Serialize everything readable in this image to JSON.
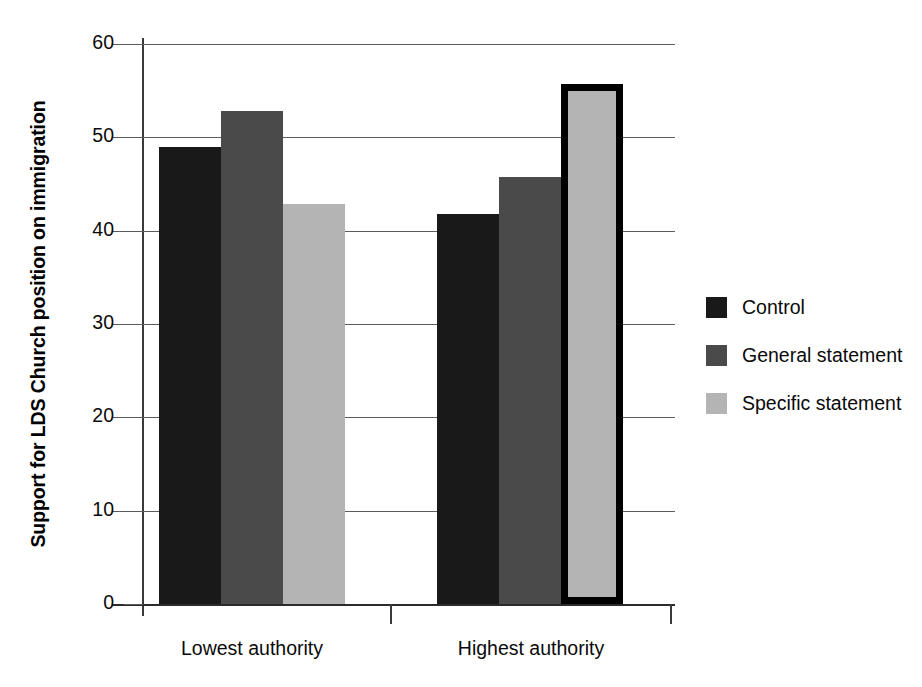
{
  "chart_data": {
    "type": "bar",
    "title": "",
    "subtitle": "",
    "xlabel": "",
    "ylabel": "Support for LDS Church position on immigration",
    "categories": [
      "Lowest authority",
      "Highest authority"
    ],
    "series": [
      {
        "name": "Control",
        "color": "#191919",
        "values": [
          49.0,
          41.8
        ]
      },
      {
        "name": "General statement",
        "color": "#4a4a4a",
        "values": [
          52.8,
          45.7
        ]
      },
      {
        "name": "Specific statement",
        "color": "#b4b4b4",
        "values": [
          42.9,
          55.7
        ]
      }
    ],
    "ylim": [
      0,
      60
    ],
    "yticks": [
      0,
      10,
      20,
      30,
      40,
      50,
      60
    ],
    "ytick_labels": [
      "0",
      "10",
      "20",
      "30",
      "40",
      "50",
      "60"
    ],
    "grid": true,
    "grid_axis": "y",
    "legend_position": "right",
    "highlighted_bar": {
      "category": "Highest authority",
      "series": "Specific statement",
      "outline_color": "#000000"
    }
  },
  "legend": {
    "entries": [
      {
        "label": "Control",
        "swatch": "legend-swatch-control"
      },
      {
        "label": "General statement",
        "swatch": "legend-swatch-general-statement"
      },
      {
        "label": "Specific statement",
        "swatch": "legend-swatch-specific-statement"
      }
    ]
  }
}
